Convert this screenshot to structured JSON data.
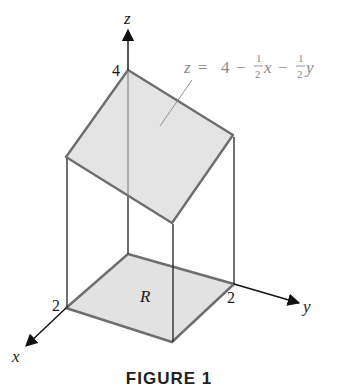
{
  "figure": {
    "caption": "FIGURE 1",
    "axes": {
      "x_label": "x",
      "y_label": "y",
      "z_label": "z"
    },
    "ticks": {
      "z_intercept": "4",
      "x_tick": "2",
      "y_tick": "2"
    },
    "region_label": "R",
    "plane_equation": {
      "lhs": "z",
      "eq": "=",
      "const": "4",
      "minus1": "−",
      "frac1_num": "1",
      "frac1_den": "2",
      "var1": "x",
      "minus2": "−",
      "frac2_num": "1",
      "frac2_den": "2",
      "var2": "y",
      "full": "z = 4 − ½x − ½y"
    },
    "colors": {
      "surface_fill": "#e2e2e2",
      "edge": "#6e6e6e",
      "axis": "#1a1a1a"
    }
  }
}
